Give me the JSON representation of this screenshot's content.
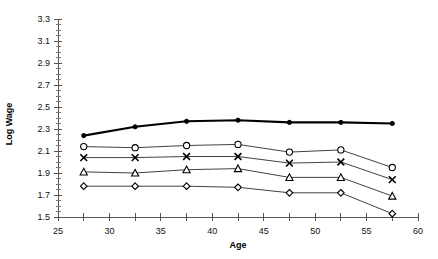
{
  "chart_data": {
    "type": "line",
    "title": "",
    "xlabel": "Age",
    "ylabel": "Log Wage",
    "xlim": [
      25,
      60
    ],
    "ylim": [
      1.5,
      3.3
    ],
    "xticks": [
      25,
      30,
      35,
      40,
      45,
      50,
      55,
      60
    ],
    "xtick_labels": [
      "25",
      "30",
      "35",
      "40",
      "45",
      "50",
      "55",
      "60"
    ],
    "x_minor_step": 2.5,
    "yticks": [
      1.5,
      1.7,
      1.9,
      2.1,
      2.3,
      2.5,
      2.7,
      2.9,
      3.1,
      3.3
    ],
    "ytick_labels": [
      "1.5",
      "1.7",
      "1.9",
      "2.1",
      "2.3",
      "2.5",
      "2.7",
      "2.9",
      "3.1",
      "3.3"
    ],
    "y_minor_step": 0.05,
    "grid": false,
    "legend": "none",
    "x": [
      27.5,
      32.5,
      37.5,
      42.5,
      47.5,
      52.5,
      57.5
    ],
    "series": [
      {
        "name": "series-1",
        "marker": "filled-circle",
        "line_weight": "bold",
        "values": [
          2.24,
          2.32,
          2.37,
          2.38,
          2.36,
          2.36,
          2.35
        ]
      },
      {
        "name": "series-2",
        "marker": "open-circle",
        "line_weight": "normal",
        "values": [
          2.14,
          2.13,
          2.15,
          2.16,
          2.09,
          2.11,
          1.95
        ]
      },
      {
        "name": "series-3",
        "marker": "cross",
        "line_weight": "normal",
        "values": [
          2.04,
          2.04,
          2.05,
          2.05,
          1.99,
          2.0,
          1.84
        ]
      },
      {
        "name": "series-4",
        "marker": "triangle",
        "line_weight": "normal",
        "values": [
          1.91,
          1.9,
          1.93,
          1.94,
          1.86,
          1.86,
          1.69
        ]
      },
      {
        "name": "series-5",
        "marker": "diamond",
        "line_weight": "normal",
        "values": [
          1.78,
          1.78,
          1.78,
          1.77,
          1.72,
          1.72,
          1.53
        ]
      }
    ],
    "colors": {
      "line": "#2b2b2b",
      "line_bold": "#000000",
      "axis": "#555555",
      "text": "#111111",
      "background": "#ffffff"
    }
  }
}
